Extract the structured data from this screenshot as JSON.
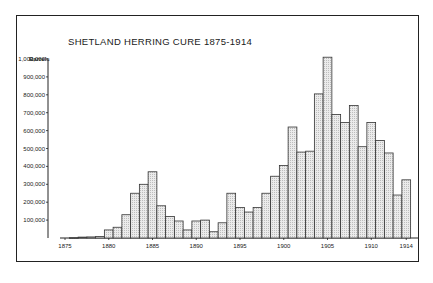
{
  "chart_data": {
    "type": "bar",
    "title": "SHETLAND HERRING CURE 1875-1914",
    "xlabel": "",
    "ylabel": "Barrels",
    "ylim": [
      0,
      1000000
    ],
    "grid": false,
    "legend": null,
    "yticks": [
      "100,000",
      "200,000",
      "300,000",
      "400,000",
      "500,000",
      "600,000",
      "700,000",
      "800,000",
      "900,000",
      "1,000,000"
    ],
    "xticks": [
      "1875",
      "1880",
      "1885",
      "1890",
      "1895",
      "1900",
      "1905",
      "1910",
      "1914"
    ],
    "categories": [
      1876,
      1877,
      1878,
      1879,
      1880,
      1881,
      1882,
      1883,
      1884,
      1885,
      1886,
      1887,
      1888,
      1889,
      1890,
      1891,
      1892,
      1893,
      1894,
      1895,
      1896,
      1897,
      1898,
      1899,
      1900,
      1901,
      1902,
      1903,
      1904,
      1905,
      1906,
      1907,
      1908,
      1909,
      1910,
      1911,
      1912,
      1913,
      1914
    ],
    "values": [
      2000,
      5000,
      6000,
      8000,
      45000,
      60000,
      130000,
      250000,
      300000,
      370000,
      180000,
      120000,
      95000,
      45000,
      95000,
      100000,
      35000,
      85000,
      250000,
      170000,
      145000,
      170000,
      250000,
      345000,
      405000,
      620000,
      480000,
      485000,
      805000,
      1010000,
      690000,
      645000,
      740000,
      510000,
      645000,
      545000,
      475000,
      240000,
      325000
    ]
  },
  "colors": {
    "bar_fill": "#e4e4e4",
    "bar_stroke": "#333333",
    "axis": "#222222",
    "frame": "#222222"
  }
}
